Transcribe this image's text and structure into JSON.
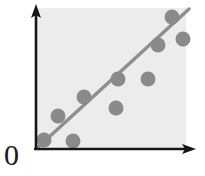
{
  "figure": {
    "origin_label": "0",
    "background_color": "#ffffff",
    "plot_area_color": "#ececec",
    "axis_color": "#161616",
    "point_color": "#8a8a8a",
    "point_edge_color": "#7b7b7b",
    "line_color": "#8f8f8f"
  },
  "axes": {
    "x_axis_name": "x-axis",
    "y_axis_name": "y-axis",
    "x_axis_label": "",
    "y_axis_label": "",
    "arrowheads": "both"
  },
  "chart_data": {
    "type": "scatter",
    "title": "",
    "xlabel": "",
    "ylabel": "",
    "xlim": [
      0,
      10
    ],
    "ylim": [
      0,
      10
    ],
    "grid": false,
    "legend": null,
    "origin_tick_label": "0",
    "points": [
      {
        "x": 0.55,
        "y": 0.75
      },
      {
        "x": 2.05,
        "y": 0.65
      },
      {
        "x": 1.55,
        "y": 2.45
      },
      {
        "x": 3.55,
        "y": 3.75
      },
      {
        "x": 5.85,
        "y": 2.95
      },
      {
        "x": 6.05,
        "y": 5.25
      },
      {
        "x": 8.15,
        "y": 5.15
      },
      {
        "x": 9.75,
        "y": 7.35
      },
      {
        "x": 10.75,
        "y": 9.55
      },
      {
        "x": 11.55,
        "y": 8.15
      }
    ],
    "fit_line": {
      "name": "regression-line",
      "x_start": 0.0,
      "y_start": 0.0,
      "x_end": 12.0,
      "y_end": 11.6,
      "slope": 0.97,
      "intercept": 0.0
    }
  },
  "geometry": {
    "plot_rect": {
      "x": 36,
      "y": 8,
      "width": 150,
      "height": 140
    },
    "y_axis": {
      "x": 36,
      "y_top": 6,
      "y_bottom": 150
    },
    "x_axis": {
      "y": 149,
      "x_left": 34,
      "x_right": 196
    },
    "point_radius": 7.5,
    "line_width": 3.5,
    "points_px": [
      {
        "cx": 44,
        "cy": 140
      },
      {
        "cx": 73,
        "cy": 141
      },
      {
        "cx": 58,
        "cy": 116
      },
      {
        "cx": 84,
        "cy": 97
      },
      {
        "cx": 116,
        "cy": 108
      },
      {
        "cx": 118,
        "cy": 79
      },
      {
        "cx": 148,
        "cy": 79
      },
      {
        "cx": 158,
        "cy": 45
      },
      {
        "cx": 172,
        "cy": 17
      },
      {
        "cx": 183,
        "cy": 39
      }
    ],
    "line_px": {
      "x1": 37,
      "y1": 148,
      "x2": 189,
      "y2": 9
    }
  }
}
